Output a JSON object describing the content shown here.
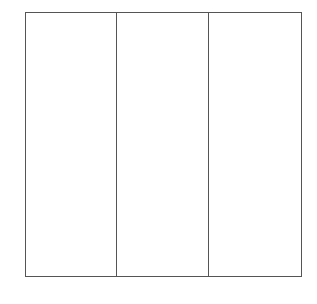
{
  "diagram": {
    "type": "three-column-box",
    "columns": 3,
    "border_color": "#555555",
    "footer_labels": [
      {
        "text": "",
        "note": "clipped, illegible"
      },
      {
        "text": "",
        "note": "clipped, illegible"
      }
    ]
  }
}
